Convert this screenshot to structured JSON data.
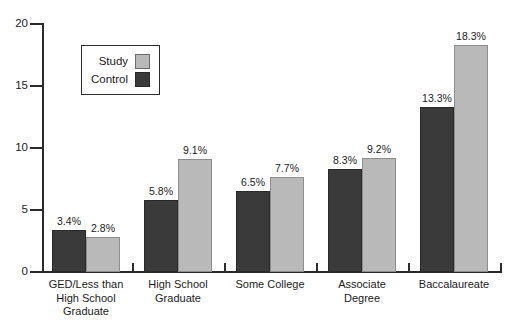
{
  "chart_data": {
    "type": "bar",
    "title": "",
    "xlabel": "",
    "ylabel": "",
    "ylim": [
      0,
      20
    ],
    "yticks": [
      0,
      5,
      10,
      15,
      20
    ],
    "ytick_labels": [
      "0",
      "5",
      "10",
      "15",
      "20"
    ],
    "grid": false,
    "legend_position": "upper-left-inside",
    "categories": [
      "GED/Less than High School Graduate",
      "High School Graduate",
      "Some College",
      "Associate Degree",
      "Baccalaureate"
    ],
    "category_lines": [
      [
        "GED/Less than",
        "High School",
        "Graduate"
      ],
      [
        "High School",
        "Graduate"
      ],
      [
        "Some College"
      ],
      [
        "Associate",
        "Degree"
      ],
      [
        "Baccalaureate"
      ]
    ],
    "series": [
      {
        "name": "Control",
        "color": "#3a3a3a",
        "values": [
          3.4,
          5.8,
          6.5,
          8.3,
          13.3
        ],
        "data_labels": [
          "3.4%",
          "5.8%",
          "6.5%",
          "8.3%",
          "13.3%"
        ]
      },
      {
        "name": "Study",
        "color": "#b9b9b9",
        "values": [
          2.8,
          9.1,
          7.7,
          9.2,
          18.3
        ],
        "data_labels": [
          "2.8%",
          "9.1%",
          "7.7%",
          "9.2%",
          "18.3%"
        ]
      }
    ]
  },
  "legend": {
    "entries": [
      {
        "label": "Study",
        "swatch": "study"
      },
      {
        "label": "Control",
        "swatch": "control"
      }
    ]
  }
}
